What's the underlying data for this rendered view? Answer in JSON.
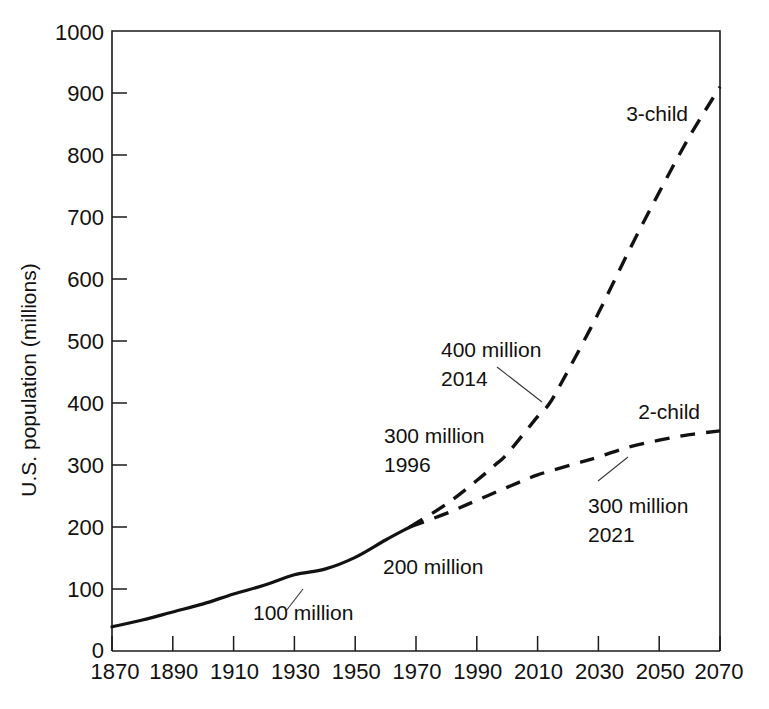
{
  "chart_data": {
    "type": "line",
    "title": "",
    "subtitle": "",
    "xlabel": "",
    "ylabel": "U.S. population (millions)",
    "xlim": [
      1870,
      2070
    ],
    "ylim": [
      0,
      1000
    ],
    "grid": false,
    "legend_position": "inline-end-labels",
    "x_ticks": [
      "1870",
      "1890",
      "1910",
      "1930",
      "1950",
      "1970",
      "1990",
      "2010",
      "2030",
      "2050",
      "2070"
    ],
    "y_ticks": [
      "0",
      "100",
      "200",
      "300",
      "400",
      "500",
      "600",
      "700",
      "800",
      "900",
      "1000"
    ],
    "series": [
      {
        "name": "historical",
        "label": "",
        "style": "solid",
        "x": [
          1870,
          1880,
          1890,
          1900,
          1910,
          1920,
          1930,
          1940,
          1950,
          1960,
          1968
        ],
        "values": [
          39,
          50,
          63,
          76,
          92,
          106,
          123,
          132,
          151,
          179,
          200
        ]
      },
      {
        "name": "3-child",
        "label": "3-child",
        "style": "dashed",
        "x": [
          1968,
          1980,
          1990,
          1996,
          2000,
          2010,
          2014,
          2020,
          2030,
          2040,
          2050,
          2060,
          2070
        ],
        "values": [
          200,
          237,
          275,
          300,
          318,
          378,
          400,
          452,
          545,
          645,
          740,
          830,
          910
        ]
      },
      {
        "name": "2-child",
        "label": "2-child",
        "style": "dashed",
        "x": [
          1968,
          1980,
          1990,
          2000,
          2010,
          2021,
          2030,
          2040,
          2050,
          2060,
          2070
        ],
        "values": [
          200,
          222,
          243,
          264,
          284,
          300,
          313,
          329,
          340,
          349,
          355
        ]
      }
    ],
    "annotations": [
      {
        "name": "ann-100-million",
        "lines": [
          "100 million"
        ],
        "x": 1918,
        "y": 92
      },
      {
        "name": "ann-200-million",
        "lines": [
          "200 million"
        ],
        "x": 1958,
        "y": 185
      },
      {
        "name": "ann-300-million-1996",
        "lines": [
          "300 million",
          "1996"
        ],
        "x": 1968,
        "y": 320
      },
      {
        "name": "ann-400-million-2014",
        "lines": [
          "400 million",
          "2014"
        ],
        "x": 1983,
        "y": 480
      },
      {
        "name": "ann-300-million-2021",
        "lines": [
          "300 million",
          "2021"
        ],
        "x": 2027,
        "y": 245
      }
    ]
  },
  "labels": {
    "y_axis_title": "U.S. population (millions)",
    "series_3_child": "3-child",
    "series_2_child": "2-child",
    "ann_100": "100 million",
    "ann_200": "200 million",
    "ann_300_1996_line1": "300 million",
    "ann_300_1996_line2": "1996",
    "ann_400_2014_line1": "400 million",
    "ann_400_2014_line2": "2014",
    "ann_300_2021_line1": "300 million",
    "ann_300_2021_line2": "2021",
    "y_0": "0",
    "y_100": "100",
    "y_200": "200",
    "y_300": "300",
    "y_400": "400",
    "y_500": "500",
    "y_600": "600",
    "y_700": "700",
    "y_800": "800",
    "y_900": "900",
    "y_1000": "1000",
    "x_1870": "1870",
    "x_1890": "1890",
    "x_1910": "1910",
    "x_1930": "1930",
    "x_1950": "1950",
    "x_1970": "1970",
    "x_1990": "1990",
    "x_2010": "2010",
    "x_2030": "2030",
    "x_2050": "2050",
    "x_2070": "2070"
  },
  "colors": {
    "background": "#ffffff",
    "ink": "#111111",
    "series": "#121212"
  }
}
